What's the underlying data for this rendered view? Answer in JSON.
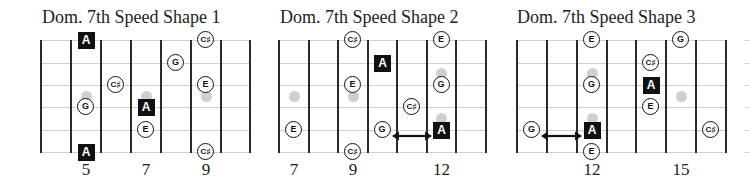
{
  "layout": {
    "string_y": [
      40,
      63,
      85,
      107,
      130,
      152
    ],
    "marker_y_single": 96,
    "marker_y_double": [
      73,
      118
    ]
  },
  "diagrams": [
    {
      "title": "Dom. 7th Speed Shape 1",
      "title_x": 42,
      "fret_lines_x": [
        41,
        71,
        101,
        131,
        161,
        191,
        221,
        250
      ],
      "first_fret": 4,
      "fret_labels": [
        {
          "fret": 5,
          "label": "5"
        },
        {
          "fret": 7,
          "label": "7"
        },
        {
          "fret": 9,
          "label": "9"
        }
      ],
      "markers": [
        {
          "fret": 5,
          "type": "single"
        },
        {
          "fret": 7,
          "type": "single"
        },
        {
          "fret": 9,
          "type": "single"
        }
      ],
      "notes": [
        {
          "fret": 5,
          "string": 0,
          "label": "A",
          "root": true
        },
        {
          "fret": 9,
          "string": 0,
          "label": "C♯",
          "root": false
        },
        {
          "fret": 8,
          "string": 1,
          "label": "G",
          "root": false
        },
        {
          "fret": 6,
          "string": 2,
          "label": "C♯",
          "root": false
        },
        {
          "fret": 9,
          "string": 2,
          "label": "E",
          "root": false
        },
        {
          "fret": 5,
          "string": 3,
          "label": "G",
          "root": false
        },
        {
          "fret": 7,
          "string": 3,
          "label": "A",
          "root": true
        },
        {
          "fret": 7,
          "string": 4,
          "label": "E",
          "root": false
        },
        {
          "fret": 5,
          "string": 5,
          "label": "A",
          "root": true
        },
        {
          "fret": 9,
          "string": 5,
          "label": "C♯",
          "root": false
        }
      ],
      "arrows": []
    },
    {
      "title": "Dom. 7th Speed Shape 2",
      "title_x": 280,
      "fret_lines_x": [
        279,
        309,
        338,
        368,
        397,
        427,
        456,
        486
      ],
      "first_fret": 7,
      "fret_labels": [
        {
          "fret": 7,
          "label": "7"
        },
        {
          "fret": 9,
          "label": "9"
        },
        {
          "fret": 12,
          "label": "12"
        }
      ],
      "markers": [
        {
          "fret": 7,
          "type": "single"
        },
        {
          "fret": 9,
          "type": "single"
        },
        {
          "fret": 12,
          "type": "double"
        }
      ],
      "notes": [
        {
          "fret": 9,
          "string": 0,
          "label": "C♯",
          "root": false
        },
        {
          "fret": 12,
          "string": 0,
          "label": "E",
          "root": false
        },
        {
          "fret": 10,
          "string": 1,
          "label": "A",
          "root": true
        },
        {
          "fret": 9,
          "string": 2,
          "label": "E",
          "root": false
        },
        {
          "fret": 12,
          "string": 2,
          "label": "G",
          "root": false
        },
        {
          "fret": 11,
          "string": 3,
          "label": "C♯",
          "root": false
        },
        {
          "fret": 7,
          "string": 4,
          "label": "E",
          "root": false
        },
        {
          "fret": 10,
          "string": 4,
          "label": "G",
          "root": false
        },
        {
          "fret": 12,
          "string": 4,
          "label": "A",
          "root": true
        },
        {
          "fret": 9,
          "string": 5,
          "label": "C♯",
          "root": false
        }
      ],
      "arrows": [
        {
          "from_fret": 10,
          "to_fret": 12,
          "string": 4,
          "label": "slide G to A"
        }
      ]
    },
    {
      "title": "Dom. 7th Speed Shape 3",
      "title_x": 517,
      "fret_lines_x": [
        517,
        547,
        577,
        607,
        636,
        666,
        696,
        726
      ],
      "first_fret": 10,
      "fret_labels": [
        {
          "fret": 12,
          "label": "12"
        },
        {
          "fret": 15,
          "label": "15"
        }
      ],
      "markers": [
        {
          "fret": 12,
          "type": "double"
        },
        {
          "fret": 15,
          "type": "single"
        }
      ],
      "notes": [
        {
          "fret": 12,
          "string": 0,
          "label": "E",
          "root": false
        },
        {
          "fret": 15,
          "string": 0,
          "label": "G",
          "root": false
        },
        {
          "fret": 14,
          "string": 1,
          "label": "C♯",
          "root": false
        },
        {
          "fret": 12,
          "string": 2,
          "label": "G",
          "root": false
        },
        {
          "fret": 14,
          "string": 2,
          "label": "A",
          "root": true
        },
        {
          "fret": 14,
          "string": 3,
          "label": "E",
          "root": false
        },
        {
          "fret": 10,
          "string": 4,
          "label": "G",
          "root": false
        },
        {
          "fret": 12,
          "string": 4,
          "label": "A",
          "root": true
        },
        {
          "fret": 16,
          "string": 4,
          "label": "C♯",
          "root": false
        },
        {
          "fret": 12,
          "string": 5,
          "label": "E",
          "root": false
        }
      ],
      "arrows": [
        {
          "from_fret": 10,
          "to_fret": 12,
          "string": 4,
          "label": "slide G to A"
        }
      ]
    }
  ]
}
